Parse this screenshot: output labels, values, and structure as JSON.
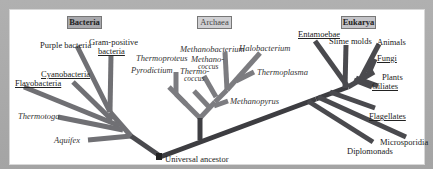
{
  "figure": {
    "colors": {
      "background": "#a9a9a9",
      "panel": "#ffffff",
      "bacteria_branch": "#6f6f73",
      "archaea_branch": "#7a7a7e",
      "eukarya_branch": "#48484c",
      "trunk": "#3a3a3e",
      "bacteria_box": "#a9a9ad",
      "archaea_box": "#cfcfd2",
      "eukarya_box": "#c2c2c6"
    },
    "domains": {
      "bacteria": "Bacteria",
      "archaea": "Archaea",
      "eukarya": "Eukarya"
    },
    "root_label": "Universal ancestor",
    "bacteria_taxa": {
      "purple": "Purple bacteria",
      "gram_positive_1": "Gram-positive",
      "gram_positive_2": "bacteria",
      "cyanobacteria": "Cyanobacteria",
      "flavobacteria": "Flavobacteria",
      "thermotoga": "Thermotoga",
      "aquifex": "Aquifex"
    },
    "archaea_taxa": {
      "thermoproteus": "Thermoproteus",
      "pyrodictium": "Pyrodictium",
      "methanobacterium": "Methanobacterium",
      "halobacterium": "Halobacterium",
      "methanococcus_1": "Methano-",
      "methanococcus_2": "coccus",
      "thermococcus_1": "Thermo-",
      "thermococcus_2": "coccus",
      "thermoplasma": "Thermoplasma",
      "methanopyrus": "Methanopyrus"
    },
    "eukarya_taxa": {
      "entamoebae": "Entamoebae",
      "slime_molds": "Slime molds",
      "animals": "Animals",
      "fungi": "Fungi",
      "plants": "Plants",
      "ciliates": "Ciliates",
      "flagellates": "Flagellates",
      "microsporidia": "Microsporidia",
      "diplomonads": "Diplomonads"
    }
  }
}
